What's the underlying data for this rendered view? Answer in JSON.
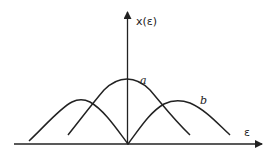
{
  "figure": {
    "y_axis_label": "x(ε)",
    "x_axis_label": "ε",
    "curve_a_label": "a",
    "curve_b_label": "b",
    "colors": {
      "ink": "#222222",
      "background": "#ffffff"
    }
  }
}
